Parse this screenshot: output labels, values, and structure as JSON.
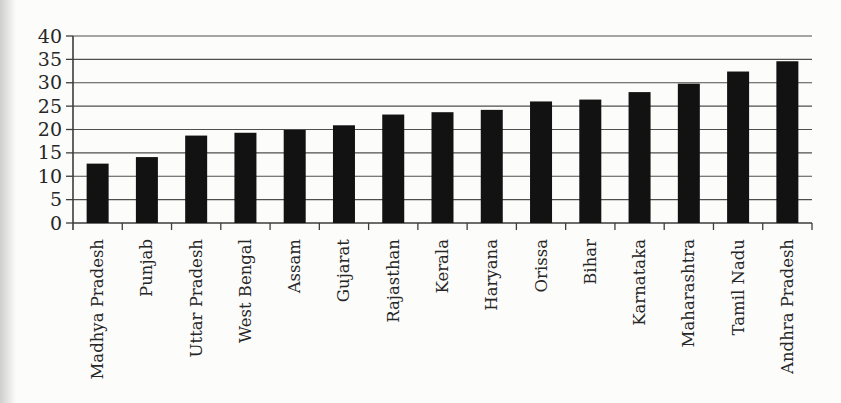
{
  "chart_data": {
    "type": "bar",
    "title": "",
    "xlabel": "",
    "ylabel": "",
    "categories": [
      "Madhya Pradesh",
      "Punjab",
      "Uttar Pradesh",
      "West Bengal",
      "Assam",
      "Gujarat",
      "Rajasthan",
      "Kerala",
      "Haryana",
      "Orissa",
      "Bihar",
      "Karnataka",
      "Maharashtra",
      "Tamil Nadu",
      "Andhra Pradesh"
    ],
    "values": [
      12.7,
      14.1,
      18.7,
      19.3,
      19.9,
      20.9,
      23.2,
      23.7,
      24.2,
      26.0,
      26.4,
      28.0,
      29.8,
      32.4,
      34.6
    ],
    "ylim": [
      0,
      40
    ],
    "yticks": [
      0,
      5,
      10,
      15,
      20,
      25,
      30,
      35,
      40
    ],
    "grid": true,
    "legend": "none",
    "x_label_rotation_deg": 90,
    "bar_color": "#121212",
    "gridline_color": "#4f4f4f",
    "axis_color": "#3c3c3c",
    "text_color": "#262626",
    "background_color": "#fcfcfb"
  }
}
